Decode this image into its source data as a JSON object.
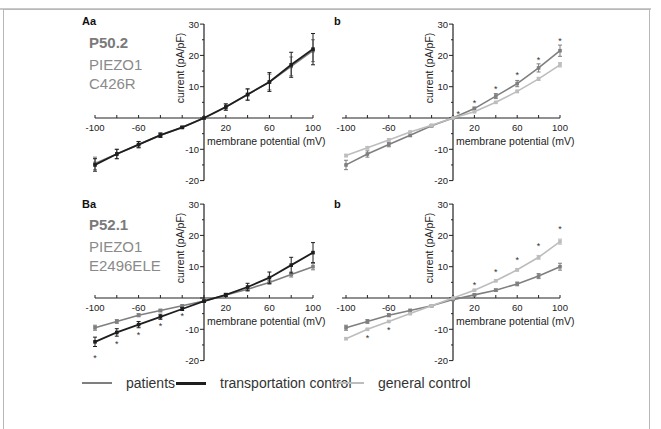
{
  "figure": {
    "panels": {
      "Aa": {
        "label": "Aa",
        "patient_id": "P50.2",
        "gene": "PIEZO1",
        "mutation": "C426R"
      },
      "Ab": {
        "label": "b"
      },
      "Ba": {
        "label": "Ba",
        "patient_id": "P52.1",
        "gene": "PIEZO1",
        "mutation": "E2496ELE"
      },
      "Bb": {
        "label": "b"
      }
    },
    "axis": {
      "xlabel": "membrane potential (mV)",
      "ylabel": "current (pA/pF)",
      "xticks": [
        "-100",
        "-60",
        "20",
        "60",
        "100"
      ],
      "yticks": [
        "30",
        "20",
        "10",
        "-10",
        "-20"
      ]
    },
    "legend": {
      "items": [
        {
          "label": "patients",
          "color": "#7f7f7f"
        },
        {
          "label": "transportation control",
          "color": "#1e1e1e"
        },
        {
          "label": "general control",
          "color": "#bdbdbd"
        }
      ]
    },
    "colors": {
      "patients": "#7f7f7f",
      "transportation_control": "#1e1e1e",
      "general_control": "#bdbdbd",
      "frame": "#b8b8b8"
    }
  },
  "chart_data": [
    {
      "panel": "Aa",
      "type": "line",
      "title": "P50.2 PIEZO1 C426R",
      "xlabel": "membrane potential (mV)",
      "ylabel": "current (pA/pF)",
      "xlim": [
        -100,
        100
      ],
      "ylim": [
        -20,
        30
      ],
      "xticks": [
        -100,
        -60,
        20,
        60,
        100
      ],
      "yticks": [
        -20,
        -10,
        10,
        20,
        30
      ],
      "grid": false,
      "x": [
        -100,
        -80,
        -60,
        -40,
        -20,
        0,
        20,
        40,
        60,
        80,
        100
      ],
      "series": [
        {
          "name": "patients",
          "values": [
            -14.5,
            -11.5,
            -8.5,
            -5.5,
            -3,
            0,
            3.5,
            7.5,
            11.5,
            16.5,
            21.5
          ],
          "error": [
            2,
            1.5,
            1,
            0.7,
            0.3,
            0,
            1,
            1.8,
            2.5,
            3,
            3.5
          ]
        },
        {
          "name": "transportation control",
          "values": [
            -15,
            -11.5,
            -8.5,
            -5.5,
            -3,
            0,
            3.5,
            7.5,
            11.5,
            17,
            22
          ],
          "error": [
            2,
            1.5,
            1,
            0.7,
            0.3,
            0,
            1,
            1.8,
            3,
            4,
            5
          ]
        }
      ],
      "significance_marks": []
    },
    {
      "panel": "Ab",
      "type": "line",
      "title": "",
      "xlabel": "membrane potential (mV)",
      "ylabel": "current (pA/pF)",
      "xlim": [
        -100,
        100
      ],
      "ylim": [
        -20,
        30
      ],
      "xticks": [
        -100,
        -60,
        20,
        60,
        100
      ],
      "yticks": [
        -20,
        -10,
        10,
        20,
        30
      ],
      "grid": false,
      "x": [
        -100,
        -80,
        -60,
        -40,
        -20,
        0,
        20,
        40,
        60,
        80,
        100
      ],
      "series": [
        {
          "name": "patients",
          "values": [
            -15,
            -11.5,
            -8.5,
            -5.5,
            -2.5,
            0,
            3,
            7,
            11,
            16,
            21.5
          ],
          "error": [
            1.5,
            1,
            0.7,
            0.5,
            0.3,
            0,
            0.5,
            0.8,
            1,
            1.3,
            1.8
          ]
        },
        {
          "name": "general control",
          "values": [
            -12,
            -9.5,
            -7,
            -4.5,
            -2.3,
            0,
            2,
            5,
            8.5,
            12.5,
            17
          ],
          "error": [
            0.4,
            0.4,
            0.4,
            0.3,
            0.2,
            0,
            0.3,
            0.3,
            0.4,
            0.5,
            0.7
          ]
        }
      ],
      "significance_marks": [
        {
          "x": 5,
          "y": 1.5
        },
        {
          "x": 20,
          "y": 5
        },
        {
          "x": 40,
          "y": 9.5
        },
        {
          "x": 60,
          "y": 14
        },
        {
          "x": 80,
          "y": 19
        },
        {
          "x": 100,
          "y": 25
        }
      ]
    },
    {
      "panel": "Ba",
      "type": "line",
      "title": "P52.1 PIEZO1 E2496ELE",
      "xlabel": "membrane potential (mV)",
      "ylabel": "current (pA/pF)",
      "xlim": [
        -100,
        100
      ],
      "ylim": [
        -20,
        30
      ],
      "xticks": [
        -100,
        -60,
        20,
        60,
        100
      ],
      "yticks": [
        -20,
        -10,
        10,
        20,
        30
      ],
      "grid": false,
      "x": [
        -100,
        -80,
        -60,
        -40,
        -20,
        0,
        20,
        40,
        60,
        80,
        100
      ],
      "series": [
        {
          "name": "patients",
          "values": [
            -9.5,
            -7.5,
            -5.5,
            -4,
            -2.5,
            -1,
            1,
            2.8,
            5,
            7.5,
            10
          ],
          "error": [
            0.8,
            0.6,
            0.5,
            0.4,
            0.3,
            0.3,
            0.3,
            0.5,
            0.6,
            0.8,
            1
          ]
        },
        {
          "name": "transportation control",
          "values": [
            -14,
            -11,
            -8.5,
            -6,
            -3.5,
            -1,
            1,
            3.5,
            6.5,
            10.5,
            14.5
          ],
          "error": [
            1.5,
            1.2,
            1,
            0.8,
            0.5,
            0.3,
            0.5,
            1.2,
            1.8,
            2.5,
            3.2
          ]
        }
      ],
      "significance_marks": [
        {
          "x": -100,
          "y": -19
        },
        {
          "x": -80,
          "y": -14.5
        },
        {
          "x": -60,
          "y": -11.5
        },
        {
          "x": -40,
          "y": -8.5
        },
        {
          "x": -20,
          "y": -5.5
        }
      ]
    },
    {
      "panel": "Bb",
      "type": "line",
      "title": "",
      "xlabel": "membrane potential (mV)",
      "ylabel": "current (pA/pF)",
      "xlim": [
        -100,
        100
      ],
      "ylim": [
        -20,
        30
      ],
      "xticks": [
        -100,
        -60,
        20,
        60,
        100
      ],
      "yticks": [
        -20,
        -10,
        10,
        20,
        30
      ],
      "grid": false,
      "x": [
        -100,
        -80,
        -60,
        -40,
        -20,
        0,
        20,
        40,
        60,
        80,
        100
      ],
      "series": [
        {
          "name": "patients",
          "values": [
            -9.5,
            -7.5,
            -5.5,
            -4,
            -2.5,
            -0.5,
            1,
            2.5,
            4.5,
            7,
            10
          ],
          "error": [
            0.8,
            0.6,
            0.5,
            0.4,
            0.3,
            0.2,
            0.3,
            0.4,
            0.6,
            0.8,
            1.1
          ]
        },
        {
          "name": "general control",
          "values": [
            -13,
            -10,
            -7.5,
            -5,
            -2.5,
            0,
            2.5,
            5.5,
            9,
            13,
            18
          ],
          "error": [
            0.3,
            0.3,
            0.3,
            0.3,
            0.2,
            0,
            0.2,
            0.3,
            0.4,
            0.6,
            0.8
          ]
        }
      ],
      "significance_marks": [
        {
          "x": -80,
          "y": -12.5
        },
        {
          "x": -60,
          "y": -10
        },
        {
          "x": 20,
          "y": 4.5
        },
        {
          "x": 40,
          "y": 8.5
        },
        {
          "x": 60,
          "y": 12.5
        },
        {
          "x": 80,
          "y": 17
        },
        {
          "x": 100,
          "y": 22.5
        }
      ]
    }
  ]
}
